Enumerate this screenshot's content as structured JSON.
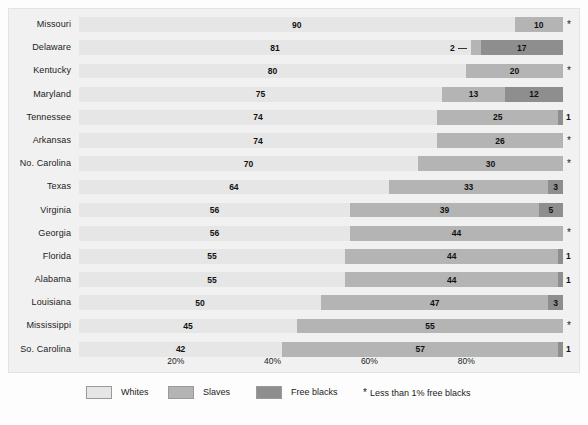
{
  "chart_data": {
    "type": "bar",
    "orientation": "horizontal",
    "stacked": true,
    "title": "",
    "xlabel": "",
    "ylabel": "",
    "xlim": [
      0,
      100
    ],
    "grid": false,
    "legend_position": "bottom",
    "categories": [
      "Missouri",
      "Delaware",
      "Kentucky",
      "Maryland",
      "Tennessee",
      "Arkansas",
      "No. Carolina",
      "Texas",
      "Virginia",
      "Georgia",
      "Florida",
      "Alabama",
      "Louisiana",
      "Mississippi",
      "So. Carolina"
    ],
    "series": [
      {
        "name": "Whites",
        "color": "#e6e6e6",
        "values": [
          90,
          81,
          80,
          75,
          74,
          74,
          70,
          64,
          56,
          56,
          55,
          55,
          50,
          45,
          42
        ]
      },
      {
        "name": "Slaves",
        "color": "#b4b4b4",
        "values": [
          10,
          2,
          20,
          13,
          25,
          26,
          30,
          33,
          39,
          44,
          44,
          44,
          47,
          55,
          57
        ]
      },
      {
        "name": "Free blacks",
        "color": "#8e8e8e",
        "values": [
          0,
          17,
          0,
          12,
          1,
          0,
          0,
          3,
          5,
          0,
          1,
          1,
          3,
          0,
          1
        ]
      }
    ],
    "footnote": "* Less than 1% free blacks",
    "xticks": [
      {
        "value": 20,
        "label": "20%"
      },
      {
        "value": 40,
        "label": "40%"
      },
      {
        "value": 60,
        "label": "60%"
      },
      {
        "value": 80,
        "label": "80%"
      }
    ]
  },
  "rows": [
    {
      "state": "Missouri",
      "whites": 90,
      "whites_label": "90",
      "slaves": 10,
      "slaves_label": "10",
      "free": 0,
      "free_label": "",
      "marker": "*"
    },
    {
      "state": "Delaware",
      "whites": 81,
      "whites_label": "81",
      "slaves": 2,
      "slaves_label": "2",
      "free": 17,
      "free_label": "17",
      "marker": ""
    },
    {
      "state": "Kentucky",
      "whites": 80,
      "whites_label": "80",
      "slaves": 20,
      "slaves_label": "20",
      "free": 0,
      "free_label": "",
      "marker": "*"
    },
    {
      "state": "Maryland",
      "whites": 75,
      "whites_label": "75",
      "slaves": 13,
      "slaves_label": "13",
      "free": 12,
      "free_label": "12",
      "marker": ""
    },
    {
      "state": "Tennessee",
      "whites": 74,
      "whites_label": "74",
      "slaves": 25,
      "slaves_label": "25",
      "free": 1,
      "free_label": "1",
      "marker": ""
    },
    {
      "state": "Arkansas",
      "whites": 74,
      "whites_label": "74",
      "slaves": 26,
      "slaves_label": "26",
      "free": 0,
      "free_label": "",
      "marker": "*"
    },
    {
      "state": "No. Carolina",
      "whites": 70,
      "whites_label": "70",
      "slaves": 30,
      "slaves_label": "30",
      "free": 0,
      "free_label": "",
      "marker": "*"
    },
    {
      "state": "Texas",
      "whites": 64,
      "whites_label": "64",
      "slaves": 33,
      "slaves_label": "33",
      "free": 3,
      "free_label": "3",
      "marker": ""
    },
    {
      "state": "Virginia",
      "whites": 56,
      "whites_label": "56",
      "slaves": 39,
      "slaves_label": "39",
      "free": 5,
      "free_label": "5",
      "marker": ""
    },
    {
      "state": "Georgia",
      "whites": 56,
      "whites_label": "56",
      "slaves": 44,
      "slaves_label": "44",
      "free": 0,
      "free_label": "",
      "marker": "*"
    },
    {
      "state": "Florida",
      "whites": 55,
      "whites_label": "55",
      "slaves": 44,
      "slaves_label": "44",
      "free": 1,
      "free_label": "1",
      "marker": ""
    },
    {
      "state": "Alabama",
      "whites": 55,
      "whites_label": "55",
      "slaves": 44,
      "slaves_label": "44",
      "free": 1,
      "free_label": "1",
      "marker": ""
    },
    {
      "state": "Louisiana",
      "whites": 50,
      "whites_label": "50",
      "slaves": 47,
      "slaves_label": "47",
      "free": 3,
      "free_label": "3",
      "marker": ""
    },
    {
      "state": "Mississippi",
      "whites": 45,
      "whites_label": "45",
      "slaves": 55,
      "slaves_label": "55",
      "free": 0,
      "free_label": "",
      "marker": "*"
    },
    {
      "state": "So. Carolina",
      "whites": 42,
      "whites_label": "42",
      "slaves": 57,
      "slaves_label": "57",
      "free": 1,
      "free_label": "1",
      "marker": ""
    }
  ],
  "axis": {
    "ticks": [
      "20%",
      "40%",
      "60%",
      "80%"
    ]
  },
  "legend": {
    "items": [
      {
        "label": "Whites",
        "color": "#e6e6e6"
      },
      {
        "label": "Slaves",
        "color": "#b4b4b4"
      },
      {
        "label": "Free blacks",
        "color": "#8e8e8e"
      }
    ],
    "asterisk": "*",
    "note": "Less than 1% free blacks"
  }
}
